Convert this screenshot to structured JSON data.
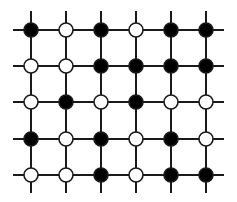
{
  "diagram": {
    "type": "square-lattice",
    "rows": 5,
    "cols": 6,
    "col_x": [
      31,
      66,
      101,
      136,
      171,
      206
    ],
    "row_y": [
      30,
      66,
      102,
      139,
      175
    ],
    "line_extent": {
      "x_min": 13,
      "x_max": 224,
      "y_min": 11,
      "y_max": 193
    },
    "node_radius": 7,
    "colors": {
      "line": "#1a1a1a",
      "filled": "#000000",
      "open_fill": "#ffffff",
      "stroke": "#1a1a1a"
    },
    "states": [
      [
        "filled",
        "open",
        "filled",
        "open",
        "filled",
        "filled"
      ],
      [
        "open",
        "open",
        "filled",
        "filled",
        "filled",
        "filled"
      ],
      [
        "open",
        "filled",
        "open",
        "filled",
        "open",
        "open"
      ],
      [
        "filled",
        "open",
        "filled",
        "open",
        "filled",
        "open"
      ],
      [
        "open",
        "open",
        "filled",
        "open",
        "filled",
        "filled"
      ]
    ]
  }
}
